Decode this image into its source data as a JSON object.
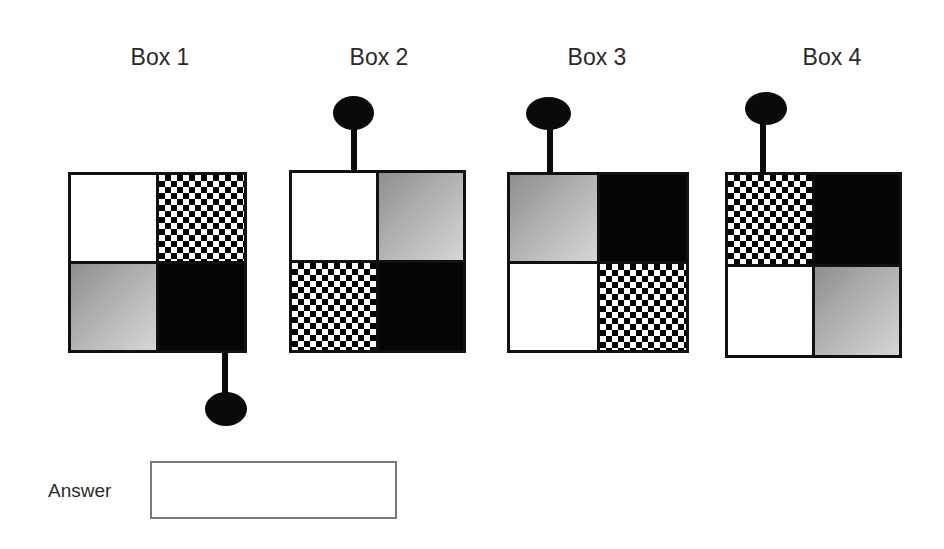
{
  "puzzle": {
    "boxes": [
      {
        "title": "Box 1",
        "cells": [
          "white",
          "checker",
          "gray",
          "black"
        ],
        "handle": "bottom-right"
      },
      {
        "title": "Box 2",
        "cells": [
          "white",
          "gray",
          "checker",
          "black"
        ],
        "handle": "top-center-left"
      },
      {
        "title": "Box 3",
        "cells": [
          "gray",
          "black",
          "white",
          "checker"
        ],
        "handle": "top-left"
      },
      {
        "title": "Box 4",
        "cells": [
          "checker",
          "black",
          "white",
          "gray"
        ],
        "handle": "top-left"
      }
    ]
  },
  "answer": {
    "label": "Answer",
    "value": "",
    "placeholder": ""
  }
}
